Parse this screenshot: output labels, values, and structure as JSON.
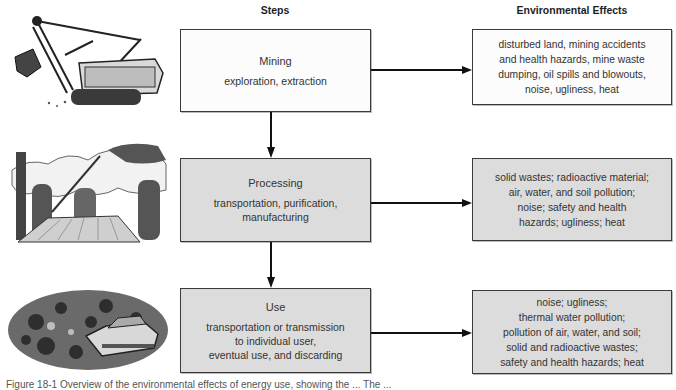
{
  "headers": {
    "steps": "Steps",
    "effects": "Environmental Effects"
  },
  "steps": [
    {
      "title": "Mining",
      "subtitle": "exploration, extraction",
      "illustration": "power-shovel-excavator",
      "shade": "white"
    },
    {
      "title": "Processing",
      "subtitle": "transportation, purification,\nmanufacturing",
      "illustration": "refinery-smokestacks",
      "shade": "gray"
    },
    {
      "title": "Use",
      "subtitle": "transportation or transmission\nto individual user,\neventual use, and discarding",
      "illustration": "junkyard-car-pile",
      "shade": "gray"
    }
  ],
  "effects": [
    {
      "text": "disturbed land, mining accidents\nand health hazards, mine waste\ndumping, oil spills and blowouts,\nnoise, ugliness, heat"
    },
    {
      "text": "solid wastes; radioactive material;\nair, water, and soil pollution;\nnoise; safety and health\nhazards; ugliness; heat"
    },
    {
      "text": "noise; ugliness;\nthermal water pollution;\npollution of air, water, and soil;\nsolid and radioactive wastes;\nsafety and health hazards; heat"
    }
  ],
  "caption": "Figure 18-1  Overview of the environmental effects of energy use, showing the ... The ...",
  "colors": {
    "box_white": "#fcfcfc",
    "box_gray": "#dcdcdc",
    "border": "#3a3a3a",
    "arrow": "#111111"
  }
}
